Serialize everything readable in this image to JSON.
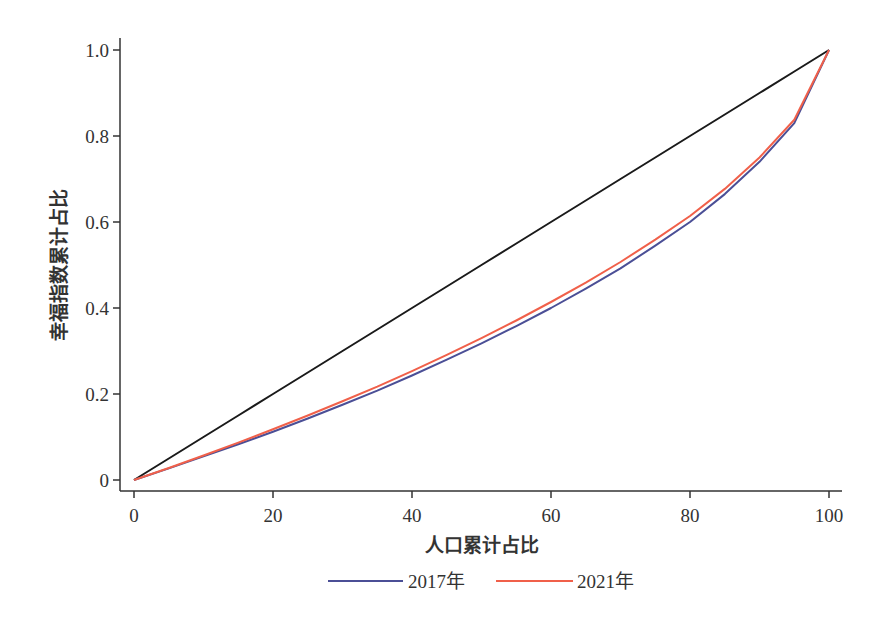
{
  "chart_data": {
    "type": "line",
    "title": "",
    "xlabel": "人口累计占比",
    "ylabel": "幸福指数累计占比",
    "xlim": [
      0,
      100
    ],
    "ylim": [
      0,
      1.0
    ],
    "xticks": [
      0,
      20,
      40,
      60,
      80,
      100
    ],
    "xtick_labels": [
      "0",
      "20",
      "40",
      "60",
      "80",
      "100"
    ],
    "yticks": [
      0,
      0.2,
      0.4,
      0.6,
      0.8,
      1.0
    ],
    "ytick_labels": [
      "0",
      "0.2",
      "0.4",
      "0.6",
      "0.8",
      "1.0"
    ],
    "grid": false,
    "legend_position": "bottom",
    "x": [
      0,
      5,
      10,
      15,
      20,
      25,
      30,
      35,
      40,
      45,
      50,
      55,
      60,
      65,
      70,
      75,
      80,
      85,
      90,
      95,
      100
    ],
    "series": [
      {
        "name": "equality-line",
        "legend": false,
        "color": "#1a1a1a",
        "values": [
          0,
          0.05,
          0.1,
          0.15,
          0.2,
          0.25,
          0.3,
          0.35,
          0.4,
          0.45,
          0.5,
          0.55,
          0.6,
          0.65,
          0.7,
          0.75,
          0.8,
          0.85,
          0.9,
          0.95,
          1.0
        ]
      },
      {
        "name": "2017年",
        "legend": true,
        "color": "#4b4f96",
        "values": [
          0,
          0.027,
          0.055,
          0.083,
          0.112,
          0.143,
          0.175,
          0.208,
          0.243,
          0.28,
          0.318,
          0.358,
          0.4,
          0.445,
          0.492,
          0.545,
          0.6,
          0.665,
          0.74,
          0.83,
          1.0
        ]
      },
      {
        "name": "2021年",
        "legend": true,
        "color": "#f0604a",
        "values": [
          0,
          0.028,
          0.057,
          0.087,
          0.118,
          0.15,
          0.183,
          0.217,
          0.253,
          0.291,
          0.33,
          0.371,
          0.414,
          0.459,
          0.507,
          0.559,
          0.614,
          0.677,
          0.75,
          0.838,
          1.0
        ]
      }
    ]
  },
  "legend": {
    "items": [
      {
        "label": "2017年",
        "color": "#4b4f96"
      },
      {
        "label": "2021年",
        "color": "#f0604a"
      }
    ]
  },
  "axes": {
    "x_title": "人口累计占比",
    "y_title": "幸福指数累计占比"
  }
}
